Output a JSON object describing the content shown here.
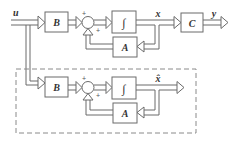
{
  "diagram": {
    "type": "block-diagram",
    "colors": {
      "line": "#6b6b6b",
      "box_fill": "#ffffff",
      "dash": "#8a8a8a",
      "text": "#333333"
    },
    "top_system": {
      "input_label": "u",
      "blocks": [
        {
          "id": "B",
          "label": "B"
        },
        {
          "id": "integrator",
          "label": "∫"
        },
        {
          "id": "A",
          "label": "A"
        },
        {
          "id": "C",
          "label": "C"
        }
      ],
      "sum_signs": [
        "+",
        "+"
      ],
      "state_label": "x",
      "output_label": "y"
    },
    "bottom_system": {
      "blocks": [
        {
          "id": "B",
          "label": "B"
        },
        {
          "id": "integrator",
          "label": "∫"
        },
        {
          "id": "A",
          "label": "A"
        }
      ],
      "sum_signs": [
        "+",
        "+"
      ],
      "state_label": "x̂",
      "enclosed_in_dashed_box": true
    }
  }
}
